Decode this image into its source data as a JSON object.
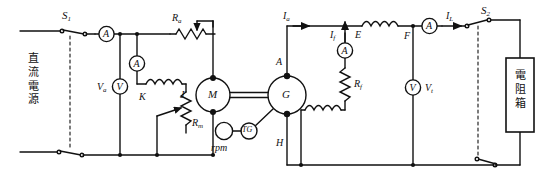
{
  "diagram": {
    "stroke_color": "#111111",
    "background": "#ffffff"
  },
  "sources": {
    "dc_supply_label": "直流電源",
    "dc_supply_chars": [
      "直",
      "流",
      "電",
      "源"
    ],
    "load_box_label": "電阻箱",
    "load_box_chars": [
      "電",
      "阻",
      "箱"
    ]
  },
  "switches": [
    {
      "name": "S1",
      "base": "S",
      "sub": "1"
    },
    {
      "name": "S2",
      "base": "S",
      "sub": "2"
    }
  ],
  "meters": {
    "line_ammeter": "A",
    "field_ammeter_motor": "A",
    "motor_voltmeter_symbol": "V",
    "motor_voltmeter_label_base": "V",
    "motor_voltmeter_label_sub": "a",
    "gen_field_ammeter": "A",
    "terminal_voltmeter_symbol": "V",
    "terminal_voltmeter_label_base": "V",
    "terminal_voltmeter_label_sub": "t",
    "load_ammeter": "A"
  },
  "machines": {
    "motor": "M",
    "generator": "G",
    "tacho": "TG",
    "speed_indicator": "rpm"
  },
  "resistors": [
    {
      "name": "Ra",
      "base": "R",
      "sub": "a"
    },
    {
      "name": "Rm",
      "base": "R",
      "sub": "m"
    },
    {
      "name": "Rf",
      "base": "R",
      "sub": "f"
    }
  ],
  "terminals": [
    {
      "name": "K",
      "label": "K"
    },
    {
      "name": "J",
      "label": "J"
    },
    {
      "name": "A",
      "label": "A"
    },
    {
      "name": "H",
      "label": "H"
    },
    {
      "name": "E",
      "label": "E"
    },
    {
      "name": "F",
      "label": "F"
    }
  ],
  "currents": [
    {
      "name": "Ia",
      "base": "I",
      "sub": "a"
    },
    {
      "name": "If",
      "base": "I",
      "sub": "f"
    },
    {
      "name": "IL",
      "base": "I",
      "sub": "L"
    }
  ]
}
